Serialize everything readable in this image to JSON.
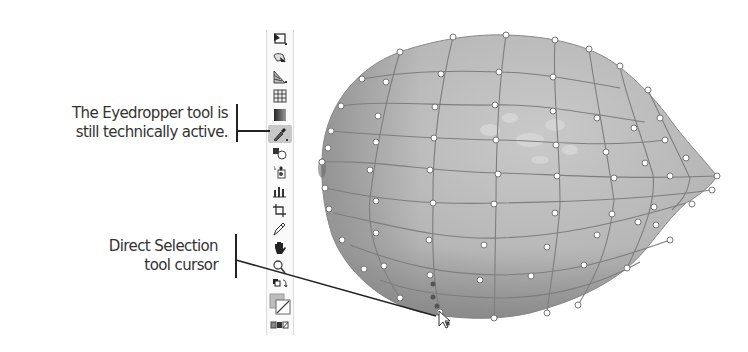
{
  "callouts": {
    "eyedropper": {
      "lines": [
        "The Eyedropper tool is",
        "still technically active."
      ]
    },
    "direct_selection": {
      "lines": [
        "Direct Selection",
        "tool cursor"
      ]
    }
  },
  "toolbar": {
    "tools": [
      {
        "name": "artboard-tool",
        "icon": "artboard-icon"
      },
      {
        "name": "slice-tool",
        "icon": "slice-icon"
      },
      {
        "name": "perspective-grid-tool",
        "icon": "perspective-grid-icon"
      },
      {
        "name": "mesh-tool",
        "icon": "mesh-icon"
      },
      {
        "name": "gradient-tool",
        "icon": "gradient-icon"
      },
      {
        "name": "eyedropper-tool",
        "icon": "eyedropper-icon",
        "active": true
      },
      {
        "name": "blend-tool",
        "icon": "blend-icon"
      },
      {
        "name": "symbol-sprayer-tool",
        "icon": "symbol-sprayer-icon"
      },
      {
        "name": "column-graph-tool",
        "icon": "column-graph-icon"
      },
      {
        "name": "crop-tool",
        "icon": "crop-icon"
      },
      {
        "name": "pencil-tool",
        "icon": "pencil-icon"
      },
      {
        "name": "hand-tool",
        "icon": "hand-icon"
      },
      {
        "name": "zoom-tool",
        "icon": "zoom-icon"
      },
      {
        "name": "swap-fill-stroke",
        "icon": "swap-icon"
      },
      {
        "name": "fill-stroke-swatch",
        "icon": "fill-stroke-icon"
      },
      {
        "name": "color-mode-buttons",
        "icon": "color-mode-icon"
      }
    ]
  },
  "colors": {
    "mesh_fill": "#b4b4b4",
    "mesh_line": "#7e7e7e",
    "anchor_fill": "#ffffff",
    "active_tool_bg": "#c8c8c8",
    "text": "#333333"
  },
  "artwork": {
    "object": "gradient-mesh-lemon",
    "cursor": "direct-selection-cursor"
  }
}
